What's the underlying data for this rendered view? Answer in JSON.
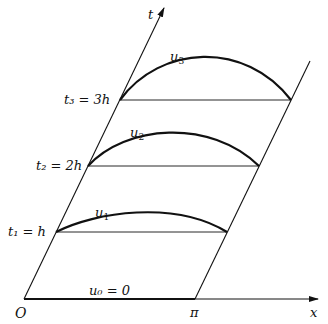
{
  "diagram": {
    "axes": {
      "x_label": "x",
      "t_label": "t",
      "origin_label": "O",
      "pi_label": "π"
    },
    "levels": [
      {
        "label": "t₁ = h",
        "curve_label": "u",
        "curve_sub": "1"
      },
      {
        "label": "t₂ = 2h",
        "curve_label": "u",
        "curve_sub": "2"
      },
      {
        "label": "t₃ = 3h",
        "curve_label": "u",
        "curve_sub": "3"
      }
    ],
    "base_label": "u₀ = 0",
    "colors": {
      "line": "#111111",
      "background": "#ffffff"
    }
  }
}
